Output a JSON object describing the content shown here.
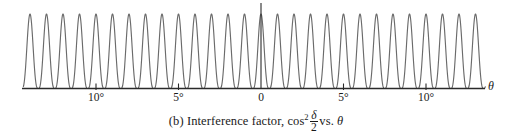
{
  "figure": {
    "label": "(b)",
    "caption_prefix": "(b) Interference factor, cos",
    "caption_exponent": "2",
    "caption_numerator": "δ",
    "caption_denominator": "2",
    "caption_suffix": "vs.",
    "caption_variable": "θ",
    "caption_full": "(b) Interference factor, cos² δ/2 vs. θ",
    "axis_label_x": "θ",
    "line_color": "#6b6b6b",
    "axis_color": "#2a2a2a",
    "background": "#ffffff"
  },
  "axis": {
    "ticks": [
      {
        "label": "10°",
        "value": -10,
        "x": 96
      },
      {
        "label": "5°",
        "value": -5,
        "x": 178.5
      },
      {
        "label": "0",
        "value": 0,
        "x": 261
      },
      {
        "label": "5°",
        "value": 5,
        "x": 343.5
      },
      {
        "label": "10°",
        "value": 10,
        "x": 426
      }
    ],
    "x_start": -14.4,
    "x_end": 13.6,
    "baseline_y": 88,
    "peak_top_y": 14,
    "vertical_axis_x": 261,
    "vertical_axis_top": 3
  },
  "chart_data": {
    "type": "line",
    "xlabel": "θ",
    "ylabel": "",
    "function": "cos^2(delta/2)",
    "xlim": [
      -14.4,
      13.6
    ],
    "ylim": [
      0,
      1
    ],
    "grid": false,
    "legend": null,
    "xticks": [
      -10,
      -5,
      0,
      5,
      10
    ],
    "xticklabels": [
      "10°",
      "5°",
      "0",
      "5°",
      "10°"
    ],
    "yticks": [],
    "fringe_period_degrees": 1.0,
    "fringe_count": 28,
    "peak_value": 1.0,
    "min_value": 0.0,
    "peak_positions_degrees": [
      -14,
      -13,
      -12,
      -11,
      -10,
      -9,
      -8,
      -7,
      -6,
      -5,
      -4,
      -3,
      -2,
      -1,
      0,
      1,
      2,
      3,
      4,
      5,
      6,
      7,
      8,
      9,
      10,
      11,
      12,
      13
    ],
    "series": [
      {
        "name": "cos^2(delta/2)",
        "description": "Two-slit interference factor; equally spaced cos-squared fringes of unit amplitude",
        "color": "#6b6b6b"
      }
    ]
  }
}
